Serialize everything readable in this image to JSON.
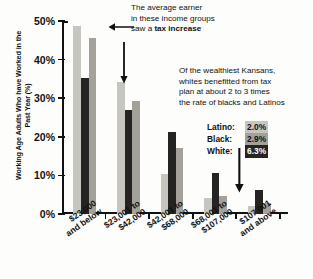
{
  "chart_data": {
    "type": "bar",
    "title": "",
    "xlabel": "",
    "ylabel": "Working Age Adults Who have Worked in the Past Year (%)",
    "ylim": [
      0,
      50
    ],
    "ytick_labels": [
      "0%",
      "10%",
      "20%",
      "30%",
      "40%",
      "50%"
    ],
    "ytick_values": [
      0,
      10,
      20,
      30,
      40,
      50
    ],
    "grid": false,
    "legend_position": "right-inset",
    "categories": [
      "$23,000 and below",
      "$23,001 to $42,000",
      "$42,001 to $68,000",
      "$68,001 to $107,000",
      "$107,001 and above"
    ],
    "category_lines": [
      [
        "$23,000",
        "and below"
      ],
      [
        "$23,001 to",
        "$42,000"
      ],
      [
        "$42,001 to",
        "$68,000"
      ],
      [
        "$68,001 to",
        "$107,000"
      ],
      [
        "$107,001",
        "and above"
      ]
    ],
    "series": [
      {
        "name": "Latino",
        "color": "#c7c5bf",
        "values": [
          48.8,
          34.2,
          10.3,
          4.2,
          2.0
        ]
      },
      {
        "name": "White",
        "color": "#262422",
        "values": [
          35.2,
          26.9,
          21.2,
          10.5,
          6.3
        ]
      },
      {
        "name": "Black",
        "color": "#a3a19a",
        "values": [
          45.6,
          29.4,
          17.1,
          4.7,
          2.9
        ]
      }
    ],
    "annotations": [
      {
        "id": "tax-increase-note",
        "lines": [
          {
            "text": "The average earner",
            "bold": false
          },
          {
            "text": "in these income groups",
            "bold": false
          },
          {
            "text_plain": "saw a ",
            "text_bold": "tax increase"
          }
        ]
      },
      {
        "id": "wealthiest-note",
        "lines": [
          "Of the wealthiest Kansans,",
          "whites benefitted from tax",
          "plan at about 2 to 3 times",
          "the rate of blacks and Latinos"
        ]
      }
    ],
    "legend_values": [
      {
        "name": "Latino:",
        "value": "2.0%",
        "key": "latino"
      },
      {
        "name": "Black:",
        "value": "2.9%",
        "key": "black"
      },
      {
        "name": "White:",
        "value": "6.3%",
        "key": "white"
      }
    ]
  },
  "annotation_top": {
    "line1": "The average earner",
    "line2": "in these income groups",
    "line3_plain": "saw a ",
    "line3_bold": "tax increase"
  },
  "annotation_right": {
    "line1": "Of the wealthiest Kansans,",
    "line2": "whites benefitted from tax",
    "line3": "plan at about 2 to 3 times",
    "line4": "the rate of blacks and Latinos"
  },
  "y_axis_title": "Working Age Adults Who have Worked in the Past Year (%)"
}
